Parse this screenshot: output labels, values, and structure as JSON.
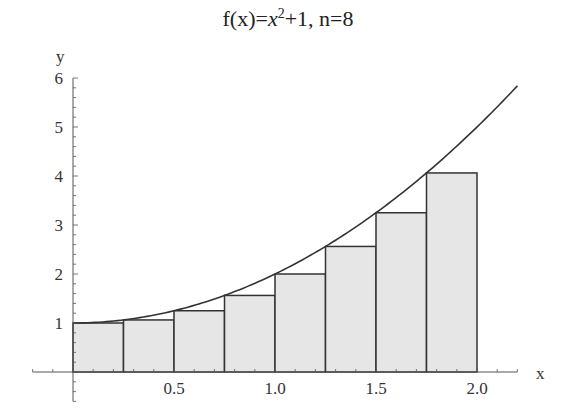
{
  "chart_data": {
    "type": "bar",
    "title_parts": {
      "prefix": "f(x)=",
      "var": "x",
      "exp": "2",
      "suffix": "+1, n=8"
    },
    "xlabel": "x",
    "ylabel": "y",
    "function": "x^2+1",
    "n": 8,
    "method": "left Riemann sum",
    "interval": [
      0,
      2
    ],
    "dx": 0.25,
    "bars": [
      {
        "x0": 0.0,
        "x1": 0.25,
        "height": 1.0
      },
      {
        "x0": 0.25,
        "x1": 0.5,
        "height": 1.0625
      },
      {
        "x0": 0.5,
        "x1": 0.75,
        "height": 1.25
      },
      {
        "x0": 0.75,
        "x1": 1.0,
        "height": 1.5625
      },
      {
        "x0": 1.0,
        "x1": 1.25,
        "height": 2.0
      },
      {
        "x0": 1.25,
        "x1": 1.5,
        "height": 2.5625
      },
      {
        "x0": 1.5,
        "x1": 1.75,
        "height": 3.25
      },
      {
        "x0": 1.75,
        "x1": 2.0,
        "height": 4.0625
      }
    ],
    "curve": {
      "x_range": [
        0,
        2.2
      ]
    },
    "xlim": [
      -0.2,
      2.2
    ],
    "ylim": [
      -0.6,
      6
    ],
    "xticks": [
      0.5,
      1.0,
      1.5,
      2.0
    ],
    "xtick_labels": [
      "0.5",
      "1.0",
      "1.5",
      "2.0"
    ],
    "yticks": [
      1,
      2,
      3,
      4,
      5,
      6
    ],
    "ytick_labels": [
      "1",
      "2",
      "3",
      "4",
      "5",
      "6"
    ],
    "grid": false,
    "legend": null,
    "colors": {
      "bar_fill": "#e6e6e6",
      "bar_stroke": "#333333",
      "curve": "#333333",
      "axis": "#555555"
    }
  }
}
